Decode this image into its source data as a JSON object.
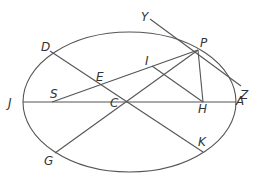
{
  "diagram": {
    "type": "ellipse-geometry",
    "labels": {
      "Y": "Y",
      "P": "P",
      "Z": "Z",
      "D": "D",
      "E": "E",
      "I": "I",
      "J": "J",
      "S": "S",
      "C": "C",
      "H": "H",
      "A": "A",
      "G": "G",
      "K": "K"
    },
    "colors": {
      "stroke": "#555555",
      "text": "#333333"
    }
  }
}
